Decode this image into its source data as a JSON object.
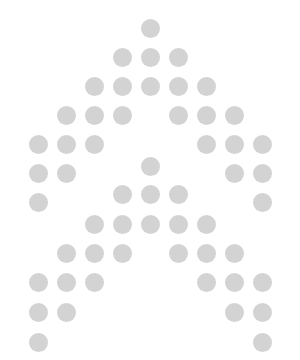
{
  "canvas": {
    "width": 300,
    "height": 360,
    "background": "#ffffff"
  },
  "dot_style": {
    "color": "#d3d3d3",
    "diameter": 19
  },
  "chevrons": [
    {
      "name": "outer-chevron",
      "dots": [
        [
          150,
          28
        ],
        [
          122,
          57
        ],
        [
          150,
          57
        ],
        [
          178,
          57
        ],
        [
          94,
          86
        ],
        [
          122,
          86
        ],
        [
          150,
          86
        ],
        [
          178,
          86
        ],
        [
          206,
          86
        ],
        [
          66,
          115
        ],
        [
          94,
          115
        ],
        [
          122,
          115
        ],
        [
          178,
          115
        ],
        [
          206,
          115
        ],
        [
          234,
          115
        ],
        [
          38,
          144
        ],
        [
          66,
          144
        ],
        [
          94,
          144
        ],
        [
          206,
          144
        ],
        [
          234,
          144
        ],
        [
          262,
          144
        ],
        [
          38,
          173
        ],
        [
          66,
          173
        ],
        [
          234,
          173
        ],
        [
          262,
          173
        ],
        [
          38,
          202
        ],
        [
          262,
          202
        ]
      ]
    },
    {
      "name": "inner-chevron",
      "dots": [
        [
          150,
          166
        ],
        [
          122,
          194
        ],
        [
          150,
          194
        ],
        [
          178,
          194
        ],
        [
          94,
          224
        ],
        [
          122,
          224
        ],
        [
          150,
          224
        ],
        [
          178,
          224
        ],
        [
          206,
          224
        ],
        [
          66,
          253
        ],
        [
          94,
          253
        ],
        [
          122,
          253
        ],
        [
          178,
          253
        ],
        [
          206,
          253
        ],
        [
          234,
          253
        ],
        [
          38,
          282
        ],
        [
          66,
          282
        ],
        [
          94,
          282
        ],
        [
          206,
          282
        ],
        [
          234,
          282
        ],
        [
          262,
          282
        ],
        [
          38,
          312
        ],
        [
          66,
          312
        ],
        [
          234,
          312
        ],
        [
          262,
          312
        ],
        [
          38,
          342
        ],
        [
          262,
          342
        ]
      ]
    }
  ]
}
